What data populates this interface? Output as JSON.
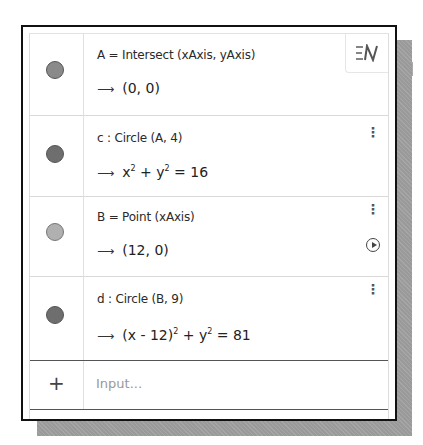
{
  "algebra_view": {
    "style_button_icon": "algebra-description-toggle-icon",
    "rows": [
      {
        "definition": "A = Intersect (xAxis, yAxis)",
        "value_arrow": "⟶",
        "value": "(0, 0)",
        "dot_color": "#8a8a8a",
        "menu_icon": "more-vertical-icon",
        "has_menu": false,
        "has_play": false
      },
      {
        "definition": "c : Circle (A, 4)",
        "value_arrow": "⟶",
        "value_parts": {
          "x": "x",
          "xexp": "2",
          "plus": " + ",
          "y": "y",
          "yexp": "2",
          "rhs": " = 16"
        },
        "dot_color": "#6e6e6e",
        "menu_icon": "more-vertical-icon",
        "has_menu": true,
        "has_play": false
      },
      {
        "definition": "B = Point (xAxis)",
        "value_arrow": "⟶",
        "value": "(12, 0)",
        "dot_color": "#b0b0b0",
        "menu_icon": "more-vertical-icon",
        "has_menu": true,
        "has_play": true,
        "play_icon": "play-animation-icon"
      },
      {
        "definition": "d : Circle (B, 9)",
        "value_arrow": "⟶",
        "value_parts": {
          "lhs": "(x - 12)",
          "lexp": "2",
          "plus": " + ",
          "y": "y",
          "yexp": "2",
          "rhs": " = 81"
        },
        "dot_color": "#6e6e6e",
        "menu_icon": "more-vertical-icon",
        "has_menu": true,
        "has_play": false
      }
    ],
    "input": {
      "plus_label": "+",
      "placeholder": "Input..."
    },
    "menu_glyph": "⋮"
  }
}
